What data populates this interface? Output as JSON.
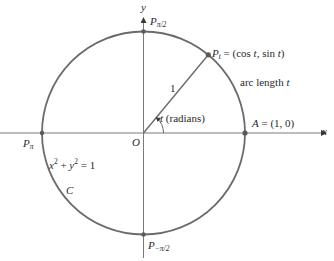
{
  "diagram": {
    "colors": {
      "circle": "#6b6b6b",
      "axis": "#7a7a7a",
      "text": "#2a2a2a",
      "point": "#5a5a5a"
    },
    "geometry": {
      "center": [
        143.5,
        133
      ],
      "radius": 101.5,
      "angle_t_degrees": 50.4
    },
    "axes": {
      "x_label": "x",
      "y_label": "y",
      "origin_label": "O"
    },
    "points": {
      "p_half_pi": {
        "base": "P",
        "sub": "π/2"
      },
      "p_pi": {
        "base": "P",
        "sub": "π"
      },
      "p_neg_half_pi": {
        "base": "P",
        "sub": "−π/2"
      },
      "p_t": {
        "base": "P",
        "sub": "t",
        "rest": " = (cos ",
        "t1": "t",
        "mid": ", sin ",
        "t2": "t",
        "end": ")"
      },
      "a": {
        "base": "A",
        "rest": " = (1, 0)"
      }
    },
    "labels": {
      "radius": "1",
      "arc_length_prefix": "arc length ",
      "arc_length_var": "t",
      "angle_var": "t",
      "angle_unit": " (radians)",
      "equation": {
        "x": "x",
        "y": "y",
        "sup": "2",
        "plus": " + ",
        "eq": " = 1"
      },
      "curve_name": "C"
    }
  }
}
